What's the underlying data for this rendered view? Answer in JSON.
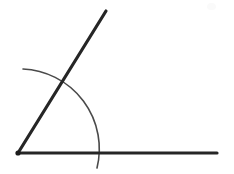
{
  "canvas": {
    "width": 234,
    "height": 174,
    "background_color": "#ffffff"
  },
  "figure": {
    "vertex": {
      "x": 18,
      "y": 153,
      "dot_radius": 2.6,
      "color": "#1c1c1c"
    },
    "rays": [
      {
        "name": "horizontal-ray",
        "from": {
          "x": 18,
          "y": 153
        },
        "to": {
          "x": 217,
          "y": 153
        },
        "stroke_width": 3.2,
        "color": "#262626"
      },
      {
        "name": "upper-ray",
        "from": {
          "x": 18,
          "y": 153
        },
        "to": {
          "x": 106,
          "y": 11
        },
        "stroke_width": 3.2,
        "color": "#262626"
      }
    ],
    "arc": {
      "name": "angle-arc",
      "center": {
        "x": 18,
        "y": 153
      },
      "radius": 80,
      "start": {
        "x": 23,
        "y": 69
      },
      "end": {
        "x": 97,
        "y": 168
      },
      "start_angle_deg": 93,
      "end_angle_deg": -11,
      "stroke_width": 1.6,
      "color": "#4a4a4a"
    },
    "intersections": [
      {
        "name": "arc-crosses-upper-ray",
        "x": 62,
        "y": 87
      },
      {
        "name": "arc-crosses-horizontal-ray",
        "x": 97,
        "y": 153
      }
    ],
    "smudge": {
      "name": "paper-smudge",
      "x": 207,
      "y": 3,
      "width": 9,
      "height": 7,
      "color": "#fafafa"
    },
    "angle_measure_deg": 58
  },
  "chart_data": {
    "type": "diagram",
    "elements": [
      {
        "kind": "point",
        "label": "vertex",
        "x": 18,
        "y": 153
      },
      {
        "kind": "segment",
        "label": "horizontal ray",
        "x1": 18,
        "y1": 153,
        "x2": 217,
        "y2": 153
      },
      {
        "kind": "segment",
        "label": "upper ray",
        "x1": 18,
        "y1": 153,
        "x2": 106,
        "y2": 11
      },
      {
        "kind": "arc",
        "label": "angle arc",
        "cx": 18,
        "cy": 153,
        "r": 80,
        "start_deg": 93,
        "end_deg": -11
      }
    ]
  }
}
